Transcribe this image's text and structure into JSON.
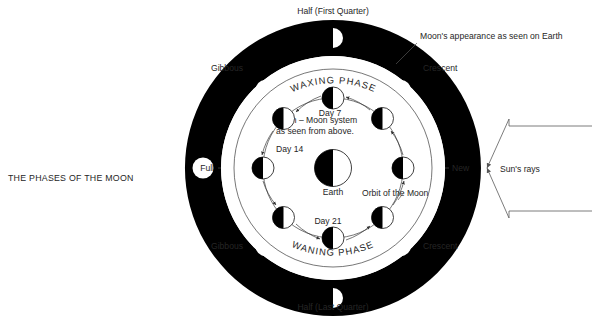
{
  "diagram": {
    "title": "THE PHASES OF THE MOON",
    "center_caption_line1": "Earth – Moon system",
    "center_caption_line2": "as seen from above.",
    "earth_label": "Earth",
    "orbit_label": "Orbit of the Moon",
    "waxing_label": "WAXING PHASE",
    "waning_label": "WANING PHASE",
    "callout_label": "Moon's appearance as seen on Earth",
    "sun_rays_label": "Sun's rays",
    "colors": {
      "ink": "#1b1b1b",
      "ring_fill": "#000000",
      "paper": "#ffffff",
      "line": "#4a4a4a"
    },
    "outer_phase_labels": [
      {
        "name": "half-first-quarter",
        "text": "Half (First Quarter)",
        "x": 333,
        "y": 14,
        "anchor": "middle"
      },
      {
        "name": "crescent-top-right",
        "text": "Crescent",
        "x": 423,
        "y": 71,
        "anchor": "start"
      },
      {
        "name": "new",
        "text": "New",
        "x": 452,
        "y": 171,
        "anchor": "start"
      },
      {
        "name": "crescent-bottom-right",
        "text": "Crescent",
        "x": 423,
        "y": 249,
        "anchor": "start"
      },
      {
        "name": "half-last-quarter",
        "text": "Half (Last Quarter)",
        "x": 333,
        "y": 310,
        "anchor": "middle"
      },
      {
        "name": "gibbous-bottom-left",
        "text": "Gibbous",
        "x": 243,
        "y": 249,
        "anchor": "end"
      },
      {
        "name": "full",
        "text": "Full",
        "x": 214,
        "y": 171,
        "anchor": "end"
      },
      {
        "name": "gibbous-top-left",
        "text": "Gibbous",
        "x": 243,
        "y": 71,
        "anchor": "end"
      }
    ],
    "outer_phase_markers": [
      {
        "name": "marker-half-first-quarter",
        "phase": "half-right",
        "angle_deg": -90
      },
      {
        "name": "marker-crescent-upper-right",
        "phase": "crescent-right",
        "angle_deg": -45
      },
      {
        "name": "marker-new",
        "phase": "new",
        "angle_deg": 0
      },
      {
        "name": "marker-crescent-lower-right",
        "phase": "crescent-right-down",
        "angle_deg": 45
      },
      {
        "name": "marker-half-last-quarter",
        "phase": "half-left",
        "angle_deg": 90
      },
      {
        "name": "marker-gibbous-lower-left",
        "phase": "gibbous",
        "angle_deg": 135
      },
      {
        "name": "marker-full",
        "phase": "full",
        "angle_deg": 180
      },
      {
        "name": "marker-gibbous-upper-left",
        "phase": "gibbous",
        "angle_deg": -135
      }
    ],
    "day_labels": [
      {
        "name": "day-7",
        "text": "Day 7",
        "x": 330,
        "y": 104
      },
      {
        "name": "day-14",
        "text": "Day 14",
        "x": 251,
        "y": 148
      },
      {
        "name": "day-21",
        "text": "Day 21",
        "x": 328,
        "y": 222
      }
    ],
    "inner_moons": [
      {
        "name": "inner-moon-day7",
        "angle_deg": -90
      },
      {
        "name": "inner-moon-ne",
        "angle_deg": -45
      },
      {
        "name": "inner-moon-east",
        "angle_deg": 0
      },
      {
        "name": "inner-moon-se",
        "angle_deg": 45
      },
      {
        "name": "inner-moon-day21",
        "angle_deg": 90
      },
      {
        "name": "inner-moon-sw",
        "angle_deg": 135
      },
      {
        "name": "inner-moon-day14",
        "angle_deg": 180
      },
      {
        "name": "inner-moon-nw",
        "angle_deg": -135
      }
    ]
  }
}
